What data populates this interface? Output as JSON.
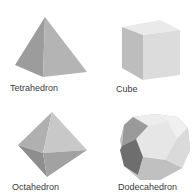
{
  "figure": {
    "solids": [
      {
        "name": "Tetrahedron",
        "position": "top-left"
      },
      {
        "name": "Cube",
        "position": "top-right"
      },
      {
        "name": "Octahedron",
        "position": "bottom-left"
      },
      {
        "name": "Dodecahedron",
        "position": "bottom-right"
      }
    ]
  },
  "colors": {
    "background": "#ffffff",
    "label": "#3a3a3a",
    "face_light": "#e4e4e4",
    "face_mid": "#b8b8b8",
    "face_dark": "#8a8a8a"
  }
}
